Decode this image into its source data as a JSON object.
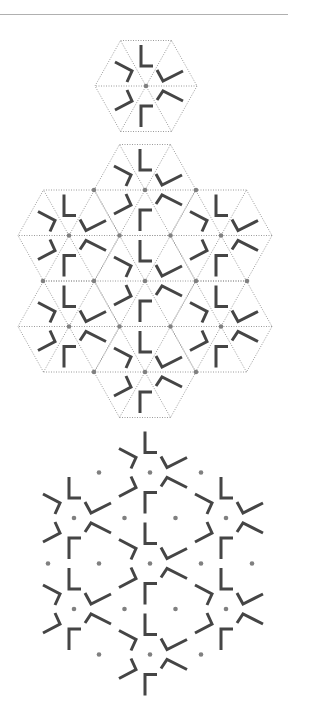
{
  "colors": {
    "background": "#ffffff",
    "rule": "#b0b0b0",
    "grid_line": "#9a9a9a",
    "stroke": "#454545",
    "dot": "#808080"
  },
  "geometry": {
    "edge": 51,
    "row_height": 45.5,
    "stroke_width": 3,
    "dot_radius": 2.3
  },
  "motif": {
    "description": "six bent bars around a hexagon center",
    "strokes": [
      {
        "name": "top-l-mark",
        "points": [
          [
            -5,
            -41
          ],
          [
            -5,
            -20
          ],
          [
            7,
            -20
          ]
        ]
      },
      {
        "name": "upper-right-v-mark",
        "points": [
          [
            11,
            -16
          ],
          [
            17,
            -5
          ],
          [
            37,
            -15
          ]
        ]
      },
      {
        "name": "lower-right-v-mark",
        "points": [
          [
            11,
            14
          ],
          [
            17,
            5
          ],
          [
            37,
            15
          ]
        ]
      },
      {
        "name": "bottom-l-mark",
        "points": [
          [
            -5,
            41
          ],
          [
            -5,
            20
          ],
          [
            7,
            20
          ]
        ]
      },
      {
        "name": "upper-left-v-mark",
        "points": [
          [
            -31,
            -24
          ],
          [
            -14,
            -15
          ],
          [
            -19,
            -4
          ]
        ]
      },
      {
        "name": "lower-left-v-mark",
        "points": [
          [
            -31,
            24
          ],
          [
            -14,
            15
          ],
          [
            -19,
            4
          ]
        ]
      }
    ]
  },
  "flower": {
    "hex_centers": [
      [
        0,
        -91
      ],
      [
        -76,
        -45.5
      ],
      [
        76,
        -45.5
      ],
      [
        0,
        0
      ],
      [
        -76,
        45.5
      ],
      [
        76,
        45.5
      ],
      [
        0,
        91
      ]
    ],
    "dots": [
      [
        0,
        -91
      ],
      [
        -76,
        -45.5
      ],
      [
        76,
        -45.5
      ],
      [
        0,
        0
      ],
      [
        -76,
        45.5
      ],
      [
        76,
        45.5
      ],
      [
        0,
        91
      ],
      [
        -25.5,
        -45.5
      ],
      [
        25.5,
        -45.5
      ],
      [
        -51,
        0
      ],
      [
        51,
        0
      ],
      [
        -25.5,
        45.5
      ],
      [
        25.5,
        45.5
      ],
      [
        -51,
        -91
      ],
      [
        51,
        -91
      ],
      [
        -102,
        0
      ],
      [
        102,
        0
      ],
      [
        -51,
        91
      ],
      [
        51,
        91
      ]
    ]
  },
  "panels": [
    {
      "name": "single-hexagon-tile",
      "type": "single",
      "center": [
        146,
        86
      ],
      "grid": true
    },
    {
      "name": "tiled-hexagon-patch",
      "type": "flower",
      "center": [
        145,
        281
      ],
      "grid": true
    },
    {
      "name": "motif-only-patch",
      "type": "flower",
      "center": [
        150,
        563.5
      ],
      "grid": false
    }
  ]
}
